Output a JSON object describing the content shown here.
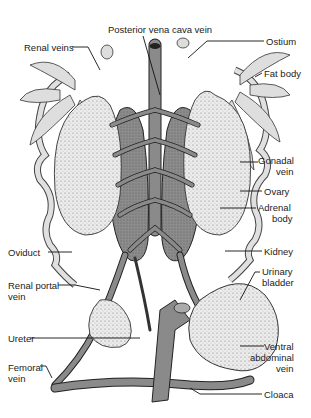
{
  "diagram": {
    "labels": {
      "posterior_vena_cava": "Posterior vena cava vein",
      "renal_veins": "Renal veins",
      "ostium": "Ostium",
      "fat_body": "Fat body",
      "gonadal_vein_1": "Gonadal",
      "gonadal_vein_2": "vein",
      "ovary": "Ovary",
      "adrenal_body_1": "Adrenal",
      "adrenal_body_2": "body",
      "kidney": "Kidney",
      "oviduct": "Oviduct",
      "urinary_bladder_1": "Urinary",
      "urinary_bladder_2": "bladder",
      "renal_portal_vein_1": "Renal portal",
      "renal_portal_vein_2": "vein",
      "ureter": "Ureter",
      "ventral_abdominal_vein_1": "Ventral",
      "ventral_abdominal_vein_2": "abdominal",
      "ventral_abdominal_vein_3": "vein",
      "femoral_vein_1": "Femoral",
      "femoral_vein_2": "vein",
      "cloaca": "Cloaca"
    },
    "colors": {
      "vessel": "#8a8a8a",
      "organ_light": "#e6e6e6",
      "kidney": "#7a7a7a",
      "line": "#222222"
    }
  }
}
